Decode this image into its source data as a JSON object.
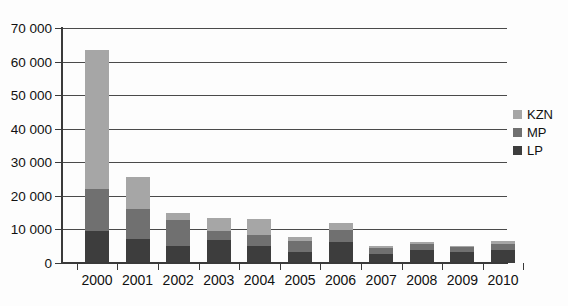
{
  "chart_data": {
    "type": "bar",
    "subtype": "stacked-bar",
    "title": "",
    "xlabel": "",
    "ylabel": "",
    "categories": [
      "2000",
      "2001",
      "2002",
      "2003",
      "2004",
      "2005",
      "2006",
      "2007",
      "2008",
      "2009",
      "2010"
    ],
    "series": [
      {
        "name": "LP",
        "color": "#3d3d3d",
        "values": [
          9500,
          7300,
          5000,
          7000,
          5000,
          3400,
          6200,
          2600,
          4000,
          3200,
          3900
        ]
      },
      {
        "name": "MP",
        "color": "#707070",
        "values": [
          12500,
          8700,
          7800,
          2500,
          3300,
          3200,
          3600,
          1900,
          1600,
          1500,
          1700
        ]
      },
      {
        "name": "KZN",
        "color": "#a6a6a6",
        "values": [
          41500,
          9700,
          2100,
          3800,
          4700,
          1200,
          2000,
          600,
          700,
          500,
          900
        ]
      }
    ],
    "totals": [
      63500,
      25700,
      14900,
      13300,
      13000,
      7800,
      11800,
      5100,
      6300,
      5200,
      6500
    ],
    "ylim": [
      0,
      70000
    ],
    "ytick_values": [
      0,
      10000,
      20000,
      30000,
      40000,
      50000,
      60000,
      70000
    ],
    "ytick_labels": [
      "0",
      "10 000",
      "20 000",
      "30 000",
      "40 000",
      "50 000",
      "60 000",
      "70 000"
    ],
    "grid": true,
    "grid_axis": "y",
    "legend_position": "right",
    "legend_entries": [
      "KZN",
      "MP",
      "LP"
    ]
  },
  "legend": {
    "items": [
      {
        "label": "KZN",
        "color": "#a6a6a6"
      },
      {
        "label": "MP",
        "color": "#707070"
      },
      {
        "label": "LP",
        "color": "#3d3d3d"
      }
    ]
  },
  "axes": {
    "y_axis_color": "#3a3a3a",
    "x_axis_color": "#3a3a3a",
    "gridline_color": "#4a4a4a"
  }
}
